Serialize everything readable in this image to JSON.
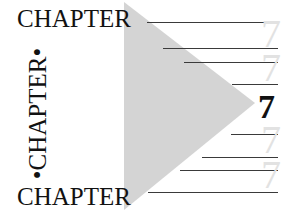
{
  "page": {
    "kind": "book-chapter-opener",
    "width": 290,
    "height": 220,
    "background_color": "#ffffff"
  },
  "labels": {
    "chapter_top": "CHAPTER",
    "chapter_bottom": "CHAPTER",
    "chapter_vertical": "•CHAPTER•",
    "bullet": "•"
  },
  "chapter_number": {
    "main": "7",
    "ghost": "7",
    "main_color": "#111111",
    "ghost_color": "#e2e2e2"
  },
  "decoration": {
    "triangle": {
      "name": "right-pointing-triangle",
      "fill_color": "#d4d4d4",
      "points": "124,2 124,210 255,103"
    },
    "rule_color": "#3a3a3a",
    "rules": [
      {
        "left": 147,
        "top": 22,
        "width": 131
      },
      {
        "left": 163,
        "top": 48,
        "width": 115
      },
      {
        "left": 184,
        "top": 62,
        "width": 94
      },
      {
        "left": 232,
        "top": 84,
        "width": 46
      },
      {
        "left": 231,
        "top": 134,
        "width": 47
      },
      {
        "left": 202,
        "top": 157,
        "width": 76
      },
      {
        "left": 180,
        "top": 170,
        "width": 98
      },
      {
        "left": 148,
        "top": 192,
        "width": 130
      }
    ],
    "ghost_numerals": [
      {
        "left": 261,
        "top": 14
      },
      {
        "left": 261,
        "top": 48
      },
      {
        "left": 261,
        "top": 120
      },
      {
        "left": 261,
        "top": 155
      }
    ],
    "main_numeral": {
      "left": 258,
      "top": 90
    }
  }
}
